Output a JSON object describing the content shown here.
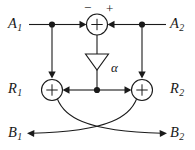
{
  "diagram": {
    "background_color": "#ffffff",
    "line_color": "#1a1a1a",
    "ports": {
      "input_left": {
        "base": "A",
        "sub": "1"
      },
      "input_right": {
        "base": "A",
        "sub": "2"
      },
      "mid_left": {
        "base": "R",
        "sub": "1"
      },
      "mid_right": {
        "base": "R",
        "sub": "2"
      },
      "output_left": {
        "base": "B",
        "sub": "1"
      },
      "output_right": {
        "base": "B",
        "sub": "2"
      }
    },
    "signs": {
      "minus": "−",
      "plus": "+"
    },
    "gain": {
      "label": "α"
    },
    "adders": {
      "top": {
        "name": "top-adder",
        "symbol": "+"
      },
      "left": {
        "name": "left-adder",
        "symbol": "+"
      },
      "right": {
        "name": "right-adder",
        "symbol": "+"
      }
    }
  }
}
